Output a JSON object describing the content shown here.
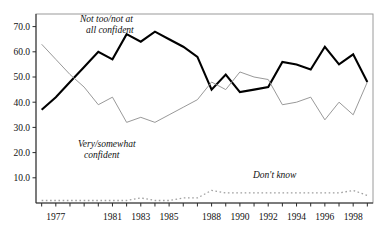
{
  "chart_data": {
    "type": "line",
    "title": "",
    "subtitle": "",
    "xlabel": "",
    "ylabel": "",
    "xlim": [
      1975.6,
      1999.4
    ],
    "ylim": [
      0,
      75
    ],
    "grid": false,
    "legend_position": "inline-annotations",
    "y_ticks": [
      10.0,
      20.0,
      30.0,
      40.0,
      50.0,
      60.0,
      70.0
    ],
    "y_tick_labels": [
      "10.0",
      "20.0",
      "30.0",
      "40.0",
      "50.0",
      "60.0",
      "70.0"
    ],
    "x_ticks": [
      1976,
      1977,
      1978,
      1979,
      1980,
      1981,
      1982,
      1983,
      1984,
      1985,
      1986,
      1987,
      1988,
      1989,
      1990,
      1991,
      1992,
      1993,
      1994,
      1995,
      1996,
      1997,
      1998,
      1999
    ],
    "x_tick_labels": [
      "1977",
      "1981",
      "1983",
      "1985",
      "1988",
      "1990",
      "1992",
      "1994",
      "1996",
      "1998"
    ],
    "x_tick_label_years": [
      1977,
      1981,
      1983,
      1985,
      1988,
      1990,
      1992,
      1994,
      1996,
      1998
    ],
    "x": [
      1976,
      1977,
      1978,
      1979,
      1980,
      1981,
      1982,
      1983,
      1984,
      1985,
      1986,
      1987,
      1988,
      1989,
      1990,
      1991,
      1992,
      1993,
      1994,
      1995,
      1996,
      1997,
      1998,
      1999
    ],
    "series": [
      {
        "name": "Not too/not at all confident",
        "style": "bold-solid",
        "color": "#000000",
        "values": [
          37,
          42,
          48,
          54,
          60,
          57,
          67,
          64,
          68,
          65,
          62,
          58,
          45,
          51,
          44,
          45,
          46,
          56,
          55,
          53,
          62,
          55,
          59,
          48
        ]
      },
      {
        "name": "Very/somewhat confident",
        "style": "thin-solid",
        "color": "#8d8d8d",
        "values": [
          63,
          57,
          51,
          46,
          39,
          42,
          32,
          34,
          32,
          35,
          38,
          41,
          48,
          45,
          52,
          50,
          49,
          39,
          40,
          42,
          33,
          40,
          35,
          48
        ]
      },
      {
        "name": "Don't know",
        "style": "dotted",
        "color": "#9f9f9f",
        "values": [
          1,
          1,
          1,
          1,
          1,
          1,
          1,
          2,
          1,
          1,
          2,
          2,
          5,
          4,
          4,
          4,
          4,
          4,
          4,
          4,
          4,
          4,
          5,
          3
        ]
      }
    ],
    "annotations": [
      {
        "text": "Not too/not at",
        "x_px": 80,
        "y_px": 22
      },
      {
        "text": "all confident",
        "x_px": 86,
        "y_px": 33
      },
      {
        "text": "Very/somewhat",
        "x_px": 78,
        "y_px": 147
      },
      {
        "text": "confident",
        "x_px": 84,
        "y_px": 158
      },
      {
        "text": "Don't know",
        "x_px": 253,
        "y_px": 178
      }
    ]
  }
}
